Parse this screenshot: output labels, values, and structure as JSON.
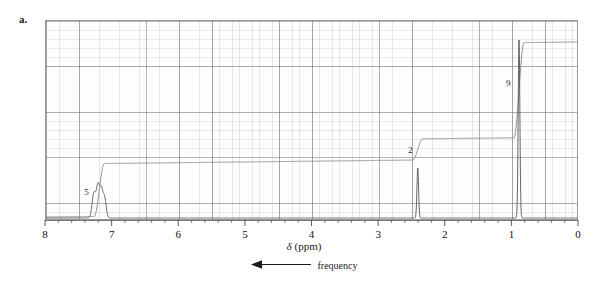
{
  "figure": {
    "panel_label": "a.",
    "background_color": "#ffffff",
    "frame_color": "#9a9a9a",
    "trace_color": "#555a60",
    "integral_color": "#7b7f86"
  },
  "axis": {
    "title_delta": "δ",
    "title_units": "(ppm)",
    "tick_labels": [
      "8",
      "7",
      "6",
      "5",
      "4",
      "3",
      "2",
      "1",
      "0"
    ],
    "tick_values": [
      8,
      7,
      6,
      5,
      4,
      3,
      2,
      1,
      0
    ],
    "xmin": 0,
    "xmax": 8,
    "direction": "decreasing-left-to-right",
    "minor_ticks_per_major": 5
  },
  "annotation": {
    "arrow_direction": "left",
    "arrow_icon": "left-arrow-icon",
    "label": "frequency"
  },
  "integration": {
    "steps": [
      {
        "label": "5",
        "ppm": 7.2,
        "label_x_ppm": 7.38,
        "height_units": 5
      },
      {
        "label": "2",
        "ppm": 2.42,
        "label_x_ppm": 2.52,
        "height_units": 2
      },
      {
        "label": "9",
        "ppm": 0.9,
        "label_x_ppm": 1.05,
        "height_units": 9
      }
    ]
  },
  "chart_data": {
    "type": "line",
    "title": "",
    "xlabel": "δ (ppm)",
    "ylabel": "",
    "xlim": [
      8,
      0
    ],
    "ylim": [
      0,
      1
    ],
    "grid": true,
    "legend": "none",
    "series": [
      {
        "name": "1H NMR spectrum",
        "peaks": [
          {
            "ppm": 7.28,
            "rel_intensity": 0.14,
            "multiplicity": "multiplet",
            "width": 0.035,
            "assignment": "aromatic H"
          },
          {
            "ppm": 7.22,
            "rel_intensity": 0.17,
            "multiplicity": "multiplet",
            "width": 0.03,
            "assignment": "aromatic H"
          },
          {
            "ppm": 7.17,
            "rel_intensity": 0.15,
            "multiplicity": "multiplet",
            "width": 0.03,
            "assignment": "aromatic H"
          },
          {
            "ppm": 7.12,
            "rel_intensity": 0.11,
            "multiplicity": "multiplet",
            "width": 0.03,
            "assignment": "aromatic H"
          },
          {
            "ppm": 2.42,
            "rel_intensity": 0.28,
            "multiplicity": "singlet",
            "width": 0.016,
            "assignment": "CH2"
          },
          {
            "ppm": 0.9,
            "rel_intensity": 1.0,
            "multiplicity": "singlet",
            "width": 0.016,
            "assignment": "C(CH3)3"
          },
          {
            "ppm": 0.0,
            "rel_intensity": 0.11,
            "multiplicity": "singlet",
            "width": 0.012,
            "assignment": "TMS reference"
          }
        ]
      },
      {
        "name": "integral trace",
        "step_ppm": [
          7.2,
          2.42,
          0.9
        ],
        "step_relative_heights": [
          5,
          2,
          9
        ],
        "total_protons": 16
      }
    ]
  }
}
